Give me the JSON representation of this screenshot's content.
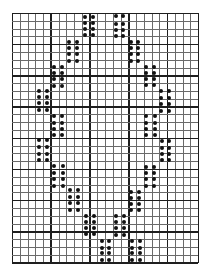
{
  "chart_data": {
    "type": "grid-pattern",
    "title": "",
    "grid": {
      "columns": 24,
      "rows": 32,
      "major_every_columns": 5,
      "major_every_rows": 4,
      "origin_px": [
        12,
        13
      ],
      "cell_width_px": 7.75,
      "cell_height_px": 7.8,
      "line_color": "#6a6a6a",
      "major_line_color": "#1e1e1e",
      "background": "#ffffff"
    },
    "dot_color": "#111111",
    "dot_groups": [
      {
        "x": [
          85,
          93
        ],
        "y": [
          17,
          23,
          29,
          35
        ]
      },
      {
        "x": [
          116,
          123
        ],
        "y": [
          16,
          24,
          30,
          36
        ]
      },
      {
        "x": [
          69,
          77
        ],
        "y": [
          42,
          48,
          54,
          61
        ]
      },
      {
        "x": [
          131,
          138
        ],
        "y": [
          42,
          48,
          54,
          61
        ]
      },
      {
        "x": [
          54,
          62
        ],
        "y": [
          67,
          73,
          79,
          86
        ]
      },
      {
        "x": [
          146,
          154
        ],
        "y": [
          67,
          73,
          79,
          85
        ]
      },
      {
        "x": [
          39,
          47
        ],
        "y": [
          91,
          97,
          103,
          110
        ]
      },
      {
        "x": [
          161,
          169
        ],
        "y": [
          91,
          98,
          104,
          111
        ]
      },
      {
        "x": [
          54,
          62
        ],
        "y": [
          116,
          123,
          129,
          135
        ]
      },
      {
        "x": [
          146,
          155
        ],
        "y": [
          116,
          123,
          129,
          135
        ]
      },
      {
        "x": [
          39,
          47
        ],
        "y": [
          140,
          147,
          154,
          160
        ]
      },
      {
        "x": [
          162,
          169
        ],
        "y": [
          141,
          148,
          154,
          160
        ]
      },
      {
        "x": [
          54,
          63
        ],
        "y": [
          166,
          173,
          179,
          186
        ]
      },
      {
        "x": [
          146,
          154
        ],
        "y": [
          167,
          173,
          179,
          186
        ]
      },
      {
        "x": [
          70,
          78
        ],
        "y": [
          190,
          197,
          203,
          210
        ]
      },
      {
        "x": [
          131,
          139
        ],
        "y": [
          192,
          198,
          204,
          210
        ]
      },
      {
        "x": [
          86,
          94
        ],
        "y": [
          216,
          222,
          228,
          234
        ]
      },
      {
        "x": [
          116,
          124
        ],
        "y": [
          216,
          222,
          228,
          235
        ]
      },
      {
        "x": [
          102,
          109
        ],
        "y": [
          241,
          248,
          253,
          260
        ]
      },
      {
        "x": [
          132,
          140
        ],
        "y": [
          241,
          248,
          253,
          260
        ]
      }
    ]
  }
}
